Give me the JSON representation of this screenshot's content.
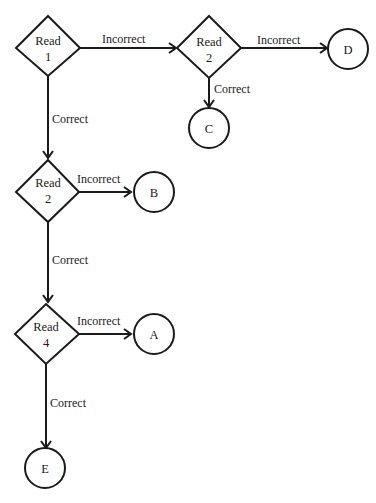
{
  "diagram": {
    "type": "flowchart",
    "decisions": [
      {
        "id": "read1",
        "line1": "Read",
        "line2": "1"
      },
      {
        "id": "read2_top",
        "line1": "Read",
        "line2": "2"
      },
      {
        "id": "read2_mid",
        "line1": "Read",
        "line2": "2"
      },
      {
        "id": "read4",
        "line1": "Read",
        "line2": "4"
      }
    ],
    "terminals": [
      {
        "id": "D",
        "label": "D"
      },
      {
        "id": "C",
        "label": "C"
      },
      {
        "id": "B",
        "label": "B"
      },
      {
        "id": "A",
        "label": "A"
      },
      {
        "id": "E",
        "label": "E"
      }
    ],
    "edges": [
      {
        "from": "read1",
        "to": "read2_top",
        "label": "Incorrect"
      },
      {
        "from": "read2_top",
        "to": "D",
        "label": "Incorrect"
      },
      {
        "from": "read2_top",
        "to": "C",
        "label": "Correct"
      },
      {
        "from": "read1",
        "to": "read2_mid",
        "label": "Correct"
      },
      {
        "from": "read2_mid",
        "to": "B",
        "label": "Incorrect"
      },
      {
        "from": "read2_mid",
        "to": "read4",
        "label": "Correct"
      },
      {
        "from": "read4",
        "to": "A",
        "label": "Incorrect"
      },
      {
        "from": "read4",
        "to": "E",
        "label": "Correct"
      }
    ]
  }
}
